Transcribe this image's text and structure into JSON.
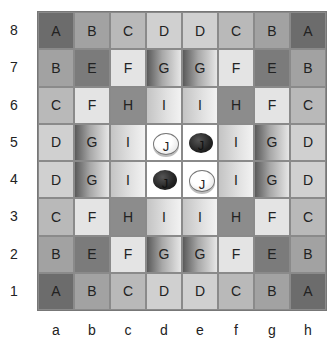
{
  "board": {
    "ranks": [
      "8",
      "7",
      "6",
      "5",
      "4",
      "3",
      "2",
      "1"
    ],
    "files": [
      "a",
      "b",
      "c",
      "d",
      "e",
      "f",
      "g",
      "h"
    ],
    "rows": [
      [
        "A",
        "B",
        "C",
        "D",
        "D",
        "C",
        "B",
        "A"
      ],
      [
        "B",
        "E",
        "F",
        "G",
        "G",
        "F",
        "E",
        "B"
      ],
      [
        "C",
        "F",
        "H",
        "I",
        "I",
        "H",
        "F",
        "C"
      ],
      [
        "D",
        "G",
        "I",
        "J",
        "J",
        "I",
        "G",
        "D"
      ],
      [
        "D",
        "G",
        "I",
        "J",
        "J",
        "I",
        "G",
        "D"
      ],
      [
        "C",
        "F",
        "H",
        "I",
        "I",
        "H",
        "F",
        "C"
      ],
      [
        "B",
        "E",
        "F",
        "G",
        "G",
        "F",
        "E",
        "B"
      ],
      [
        "A",
        "B",
        "C",
        "D",
        "D",
        "C",
        "B",
        "A"
      ]
    ],
    "pieces": [
      {
        "square": "d5",
        "color": "white",
        "label": "J"
      },
      {
        "square": "e5",
        "color": "black",
        "label": "J"
      },
      {
        "square": "d4",
        "color": "black",
        "label": "J"
      },
      {
        "square": "e4",
        "color": "white",
        "label": "J"
      }
    ]
  },
  "colors": {
    "A": "#6c6c6c",
    "B": "#a2a2a2",
    "C": "#b9b9b9",
    "D": "#d0d0d0",
    "E": "#7b7b7b",
    "F": "#e4e4e4",
    "G": "linear-gradient(to right, #5a5a5a 0%, #a8a8a8 45%, #e6e6e6 100%)",
    "H": "#8c8c8c",
    "I": "linear-gradient(to right, #c4c4c4 0%, #e2e2e2 60%, #f2f2f2 100%)",
    "J": "#ffffff"
  }
}
